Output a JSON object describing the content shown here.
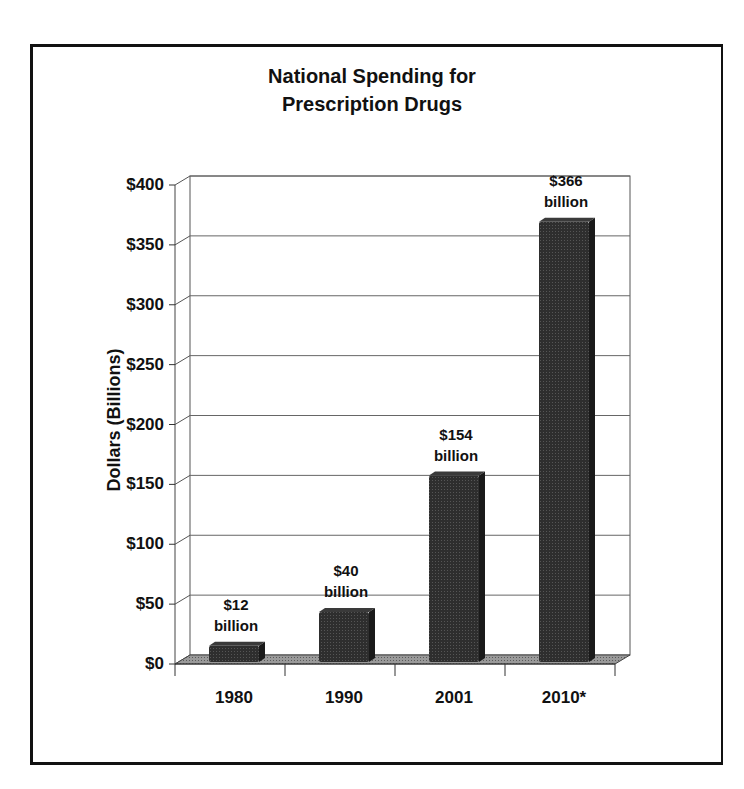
{
  "chart_data": {
    "type": "bar",
    "title": "National Spending for Prescription Drugs",
    "title_lines": [
      "National Spending for",
      "Prescription Drugs"
    ],
    "xlabel": "",
    "ylabel": "Dollars (Billions)",
    "categories": [
      "1980",
      "1990",
      "2001",
      "2010*"
    ],
    "values": [
      12,
      40,
      154,
      366
    ],
    "data_labels": [
      {
        "amount": "$12",
        "unit": "billion"
      },
      {
        "amount": "$40",
        "unit": "billion"
      },
      {
        "amount": "$154",
        "unit": "billion"
      },
      {
        "amount": "$366",
        "unit": "billion"
      }
    ],
    "ylim": [
      0,
      400
    ],
    "yticks": [
      "$0",
      "$50",
      "$100",
      "$150",
      "$200",
      "$250",
      "$300",
      "$350",
      "$400"
    ],
    "grid": true,
    "legend": null,
    "style": "3d-column",
    "bar_color": "#2a2a2a",
    "floor_color": "#8a8a8a"
  }
}
